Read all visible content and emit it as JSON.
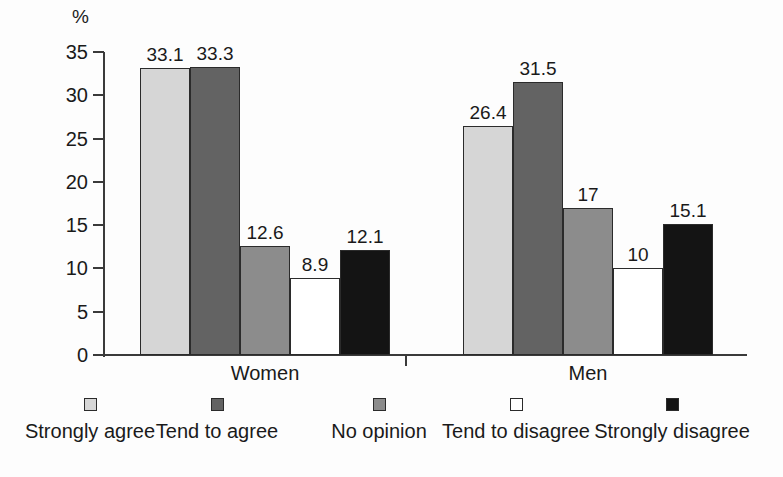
{
  "chart_data": {
    "type": "bar",
    "title": "",
    "xlabel": "",
    "ylabel": "%",
    "ylim": [
      0,
      35
    ],
    "ytick_values": [
      35,
      30,
      25,
      20,
      15,
      10,
      5,
      0
    ],
    "ytick_labels": [
      "35",
      "30",
      "25",
      "20",
      "15",
      "10",
      "5",
      "0"
    ],
    "grid": false,
    "legend_position": "bottom",
    "categories": [
      "Women",
      "Men"
    ],
    "series": [
      {
        "name": "Strongly agree",
        "color": "#d6d6d6",
        "values": [
          33.1,
          26.4
        ],
        "labels": [
          "33.1",
          "26.4"
        ]
      },
      {
        "name": "Tend to agree",
        "color": "#636363",
        "values": [
          33.3,
          31.5
        ],
        "labels": [
          "33.3",
          "31.5"
        ]
      },
      {
        "name": "No opinion",
        "color": "#8c8c8c",
        "values": [
          12.6,
          17
        ],
        "labels": [
          "12.6",
          "17"
        ]
      },
      {
        "name": "Tend to disagree",
        "color": "#ffffff",
        "values": [
          8.9,
          10
        ],
        "labels": [
          "8.9",
          "10"
        ]
      },
      {
        "name": "Strongly disagree",
        "color": "#141414",
        "values": [
          12.1,
          15.1
        ],
        "labels": [
          "12.1",
          "15.1"
        ]
      }
    ]
  },
  "axis": {
    "unit_label": "%",
    "ticks": [
      {
        "label": "35"
      },
      {
        "label": "30"
      },
      {
        "label": "25"
      },
      {
        "label": "20"
      },
      {
        "label": "15"
      },
      {
        "label": "10"
      },
      {
        "label": "5"
      },
      {
        "label": "0"
      }
    ]
  },
  "groups": [
    {
      "label": "Women",
      "bars": [
        {
          "series": "Strongly agree",
          "value": 33.1,
          "label": "33.1"
        },
        {
          "series": "Tend to agree",
          "value": 33.3,
          "label": "33.3"
        },
        {
          "series": "No opinion",
          "value": 12.6,
          "label": "12.6"
        },
        {
          "series": "Tend to disagree",
          "value": 8.9,
          "label": "8.9"
        },
        {
          "series": "Strongly disagree",
          "value": 12.1,
          "label": "12.1"
        }
      ]
    },
    {
      "label": "Men",
      "bars": [
        {
          "series": "Strongly agree",
          "value": 26.4,
          "label": "26.4"
        },
        {
          "series": "Tend to agree",
          "value": 31.5,
          "label": "31.5"
        },
        {
          "series": "No opinion",
          "value": 17,
          "label": "17"
        },
        {
          "series": "Tend to disagree",
          "value": 10,
          "label": "10"
        },
        {
          "series": "Strongly disagree",
          "value": 15.1,
          "label": "15.1"
        }
      ]
    }
  ],
  "legend": {
    "items": [
      {
        "label": "Strongly agree",
        "swatch": "#d6d6d6",
        "swatch_name": "legend-swatch-strongly-agree"
      },
      {
        "label": "Tend to agree",
        "swatch": "#636363",
        "swatch_name": "legend-swatch-tend-to-agree"
      },
      {
        "label": "No opinion",
        "swatch": "#8c8c8c",
        "swatch_name": "legend-swatch-no-opinion"
      },
      {
        "label": "Tend to disagree",
        "swatch": "#ffffff",
        "swatch_name": "legend-swatch-tend-to-disagree"
      },
      {
        "label": "Strongly disagree",
        "swatch": "#141414",
        "swatch_name": "legend-swatch-strongly-disagree"
      }
    ]
  },
  "colors": {
    "background": "#fdfdfd",
    "axis": "#3a3a3a",
    "text": "#1a1a1a",
    "bar_outline": "#2b2b2b"
  }
}
